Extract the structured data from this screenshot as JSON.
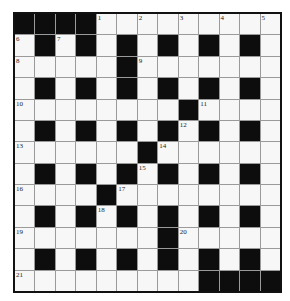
{
  "puzzle": {
    "rows": 13,
    "cols": 13,
    "layout": [
      "####.........",
      ".#.#.#.#.#.#.",
      ".....#.......",
      ".#.#.#.#.#.#.",
      "........#....",
      ".#.#.#.#.#.#.",
      "......#......",
      ".#.#.#.#.#.#.",
      "....#........",
      ".#.#.#.#.#.#.",
      ".......#.....",
      ".#.#.#.#.#.#.",
      ".........####"
    ],
    "numbers": [
      {
        "n": "1",
        "r": 0,
        "c": 4
      },
      {
        "n": "2",
        "r": 0,
        "c": 6
      },
      {
        "n": "3",
        "r": 0,
        "c": 8
      },
      {
        "n": "4",
        "r": 0,
        "c": 10
      },
      {
        "n": "5",
        "r": 0,
        "c": 12
      },
      {
        "n": "6",
        "r": 1,
        "c": 0
      },
      {
        "n": "7",
        "r": 1,
        "c": 2
      },
      {
        "n": "8",
        "r": 2,
        "c": 0
      },
      {
        "n": "9",
        "r": 2,
        "c": 6
      },
      {
        "n": "10",
        "r": 4,
        "c": 0
      },
      {
        "n": "11",
        "r": 4,
        "c": 9
      },
      {
        "n": "12",
        "r": 5,
        "c": 8
      },
      {
        "n": "13",
        "r": 6,
        "c": 0
      },
      {
        "n": "14",
        "r": 6,
        "c": 7
      },
      {
        "n": "15",
        "r": 7,
        "c": 6
      },
      {
        "n": "16",
        "r": 8,
        "c": 0
      },
      {
        "n": "17",
        "r": 8,
        "c": 5
      },
      {
        "n": "18",
        "r": 9,
        "c": 4
      },
      {
        "n": "19",
        "r": 10,
        "c": 0
      },
      {
        "n": "20",
        "r": 10,
        "c": 8
      },
      {
        "n": "21",
        "r": 12,
        "c": 0
      }
    ]
  },
  "colors": {
    "block": "#0d0d0d",
    "cell": "#f7f7f7",
    "gridline": "#9a9a9a",
    "border": "#111111"
  }
}
